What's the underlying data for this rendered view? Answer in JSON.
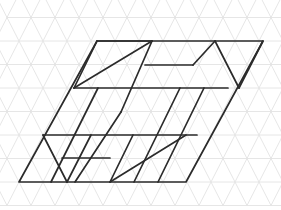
{
  "figure": {
    "canvas": {
      "width": 281,
      "height": 210,
      "background": "#ffffff"
    },
    "colors": {
      "grid_stroke": "#e3e3e3",
      "figure_stroke": "#2b2b2b"
    },
    "stroke_widths": {
      "grid": 0.9,
      "figure": 1.7
    },
    "lattice": {
      "type": "triangular",
      "origin_x": 19,
      "origin_y": 182,
      "unit_right_x": 24,
      "unit_right_y": 0,
      "unit_up_x": 12,
      "unit_up_y": -23.5,
      "columns": 12,
      "rows": 9
    },
    "outline": {
      "name": "main-parallelogram",
      "points": [
        [
          97,
          41
        ],
        [
          263,
          41
        ],
        [
          186,
          182
        ],
        [
          19,
          182
        ]
      ]
    },
    "segments": [
      {
        "name": "top-edge-left-part",
        "x1": 97,
        "y1": 41,
        "x2": 152,
        "y2": 41
      },
      {
        "name": "left-upper-slant",
        "x1": 97,
        "y1": 41,
        "x2": 74,
        "y2": 88
      },
      {
        "name": "upper-long-diagonal",
        "x1": 74,
        "y1": 88,
        "x2": 152,
        "y2": 41
      },
      {
        "name": "upper-piece-right-slant",
        "x1": 152,
        "y1": 41,
        "x2": 121,
        "y2": 112
      },
      {
        "name": "row1-horizontal",
        "x1": 74,
        "y1": 88,
        "x2": 228,
        "y2": 88
      },
      {
        "name": "mid-horizontal-short",
        "x1": 145,
        "y1": 65,
        "x2": 193,
        "y2": 65
      },
      {
        "name": "mid-upper-right-slant",
        "x1": 193,
        "y1": 65,
        "x2": 215,
        "y2": 41
      },
      {
        "name": "right-v-down",
        "x1": 215,
        "y1": 41,
        "x2": 239,
        "y2": 88
      },
      {
        "name": "right-v-up",
        "x1": 239,
        "y1": 88,
        "x2": 263,
        "y2": 41
      },
      {
        "name": "inner-slant-a",
        "x1": 98,
        "y1": 88,
        "x2": 51,
        "y2": 182
      },
      {
        "name": "inner-slant-b",
        "x1": 121,
        "y1": 112,
        "x2": 75,
        "y2": 182
      },
      {
        "name": "inner-slant-c",
        "x1": 180,
        "y1": 88,
        "x2": 134,
        "y2": 182
      },
      {
        "name": "inner-slant-d",
        "x1": 204,
        "y1": 88,
        "x2": 158,
        "y2": 182
      },
      {
        "name": "row2-horizontal",
        "x1": 43,
        "y1": 135,
        "x2": 197,
        "y2": 135
      },
      {
        "name": "bottom-left-v-down",
        "x1": 43,
        "y1": 135,
        "x2": 67,
        "y2": 182
      },
      {
        "name": "bottom-left-v-up",
        "x1": 67,
        "y1": 182,
        "x2": 91,
        "y2": 135
      },
      {
        "name": "low-horizontal-short",
        "x1": 62,
        "y1": 158,
        "x2": 110,
        "y2": 158
      },
      {
        "name": "bottom-right-long-diagonal",
        "x1": 110,
        "y1": 182,
        "x2": 186,
        "y2": 135
      },
      {
        "name": "bottom-right-short-slant",
        "x1": 110,
        "y1": 182,
        "x2": 133,
        "y2": 135
      }
    ]
  }
}
